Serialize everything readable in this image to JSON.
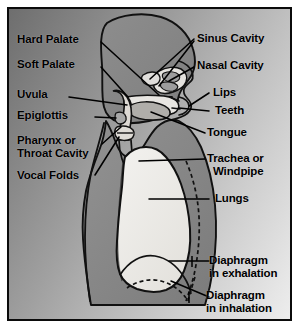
{
  "figure": {
    "kind": "labeled-anatomical-diagram",
    "background_style": "diagonal-gray-gradient",
    "colors": {
      "frame_border": "#0b0b0b",
      "leader_line": "#000000",
      "label_text": "#000000",
      "head_fill": "#8a8a8a",
      "neck_fill": "#9a9a9a",
      "torso_fill": "#8f8f8f",
      "lung_fill": "#ededeb",
      "cavity_fill": "#e2e0dc",
      "background_light": "#ededed",
      "background_dark": "#6e6e6e"
    }
  },
  "labels": {
    "left": [
      {
        "id": "hard-palate",
        "text": "Hard Palate"
      },
      {
        "id": "soft-palate",
        "text": "Soft Palate"
      },
      {
        "id": "uvula",
        "text": "Uvula"
      },
      {
        "id": "epiglottis",
        "text": "Epiglottis"
      },
      {
        "id": "pharynx-line1",
        "text": "Pharynx or"
      },
      {
        "id": "pharynx-line2",
        "text": "Throat Cavity"
      },
      {
        "id": "vocal-folds",
        "text": "Vocal Folds"
      }
    ],
    "right": [
      {
        "id": "sinus-cavity",
        "text": "Sinus Cavity"
      },
      {
        "id": "nasal-cavity",
        "text": "Nasal Cavity"
      },
      {
        "id": "lips",
        "text": "Lips"
      },
      {
        "id": "teeth",
        "text": "Teeth"
      },
      {
        "id": "tongue",
        "text": "Tongue"
      },
      {
        "id": "trachea-line1",
        "text": "Trachea or"
      },
      {
        "id": "trachea-line2",
        "text": "Windpipe"
      },
      {
        "id": "lungs",
        "text": "Lungs"
      },
      {
        "id": "diaphragm-exhalation-line1",
        "text": "Diaphragm"
      },
      {
        "id": "diaphragm-exhalation-line2",
        "text": "in exhalation"
      },
      {
        "id": "diaphragm-inhalation-line1",
        "text": "Diaphragm"
      },
      {
        "id": "diaphragm-inhalation-line2",
        "text": "in inhalation"
      }
    ]
  }
}
